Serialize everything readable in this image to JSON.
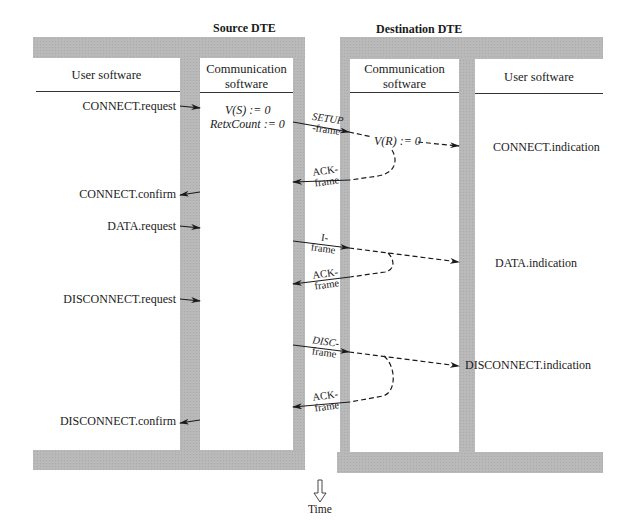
{
  "source": {
    "title": "Source DTE",
    "user_header": "User software",
    "comm_header_line1": "Communication",
    "comm_header_line2": "software",
    "init_line1": "V(S) := 0",
    "init_line2": "RetxCount := 0",
    "primitives": [
      {
        "label": "CONNECT.request",
        "direction": "in"
      },
      {
        "label": "CONNECT.confirm",
        "direction": "out"
      },
      {
        "label": "DATA.request",
        "direction": "in"
      },
      {
        "label": "DISCONNECT.request",
        "direction": "in"
      },
      {
        "label": "DISCONNECT.confirm",
        "direction": "out"
      }
    ]
  },
  "destination": {
    "title": "Destination DTE",
    "comm_header_line1": "Communication",
    "comm_header_line2": "software",
    "user_header": "User software",
    "init": "V(R) := 0",
    "primitives": [
      {
        "label": "CONNECT.indication"
      },
      {
        "label": "DATA.indication"
      },
      {
        "label": "DISCONNECT.indication"
      }
    ]
  },
  "frames": [
    {
      "line1": "SETUP",
      "line2": "-frame",
      "direction": "to-destination"
    },
    {
      "line1": "ACK-",
      "line2": "frame",
      "direction": "to-source"
    },
    {
      "line1": "I-",
      "line2": "frame",
      "direction": "to-destination"
    },
    {
      "line1": "ACK-",
      "line2": "frame",
      "direction": "to-source"
    },
    {
      "line1": "DISC-",
      "line2": "frame",
      "direction": "to-destination"
    },
    {
      "line1": "ACK-",
      "line2": "frame",
      "direction": "to-source"
    }
  ],
  "time_axis": {
    "label": "Time",
    "icon": "down-arrow-icon"
  },
  "colors": {
    "frame_gray": "#b9b9b9",
    "line": "#1a1a1a"
  }
}
